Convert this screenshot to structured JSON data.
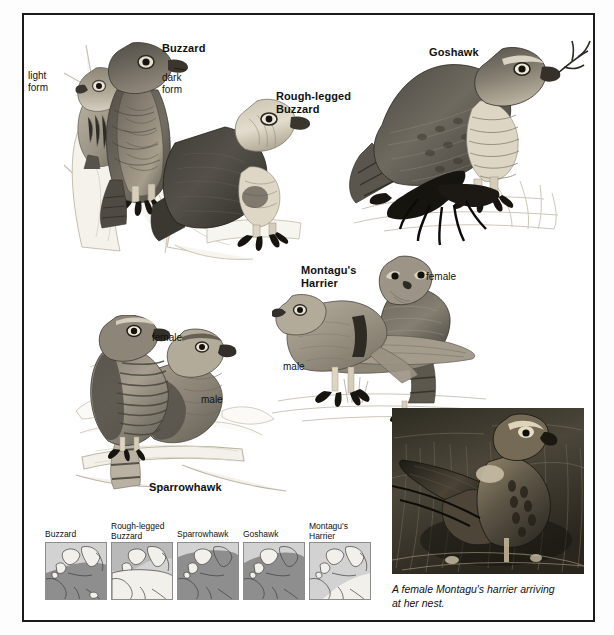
{
  "plate": {
    "title": "Birds of prey illustration plate",
    "background_color": "#ffffff",
    "border_color": "#1b1b1b"
  },
  "labels": [
    {
      "id": "buzzard-title",
      "text": "Buzzard",
      "x": 160,
      "y": 40,
      "style": "bold"
    },
    {
      "id": "light-form",
      "text": "light\nform",
      "x": 26,
      "y": 68,
      "style": "plain"
    },
    {
      "id": "dark-form",
      "text": "dark\nform",
      "x": 160,
      "y": 70,
      "style": "plain"
    },
    {
      "id": "rough-legged-title",
      "text": "Rough-legged\nBuzzard",
      "x": 274,
      "y": 88,
      "style": "bold"
    },
    {
      "id": "goshawk-title",
      "text": "Goshawk",
      "x": 427,
      "y": 44,
      "style": "bold"
    },
    {
      "id": "montagus-title",
      "text": "Montagu's\nHarrier",
      "x": 299,
      "y": 262,
      "style": "bold"
    },
    {
      "id": "harrier-female",
      "text": "female",
      "x": 424,
      "y": 268,
      "style": "plain"
    },
    {
      "id": "harrier-male",
      "text": "male",
      "x": 281,
      "y": 358,
      "style": "plain"
    },
    {
      "id": "sparrowhawk-female",
      "text": "female",
      "x": 150,
      "y": 329,
      "style": "plain"
    },
    {
      "id": "sparrowhawk-male",
      "text": "male",
      "x": 199,
      "y": 391,
      "style": "plain"
    },
    {
      "id": "sparrowhawk-title",
      "text": "Sparrowhawk",
      "x": 147,
      "y": 478,
      "style": "bold"
    }
  ],
  "maps": {
    "x": 43,
    "y": 540,
    "box_width": 62,
    "box_height": 58,
    "gap": 4,
    "sea_color": "#d2d2d2",
    "land_color": "#f2f0ea",
    "range_color": "#8e8e8e",
    "items": [
      {
        "id": "map-buzzard",
        "label": "Buzzard",
        "range_pattern": "south-and-central-europe"
      },
      {
        "id": "map-rough-legged",
        "label": "Rough-legged\nBuzzard",
        "range_pattern": "far-north-scandinavia"
      },
      {
        "id": "map-sparrowhawk",
        "label": "Sparrowhawk",
        "range_pattern": "most-of-europe"
      },
      {
        "id": "map-goshawk",
        "label": "Goshawk",
        "range_pattern": "most-of-europe"
      },
      {
        "id": "map-montagus",
        "label": "Montagu's\nHarrier",
        "range_pattern": "central-and-eastern-europe"
      }
    ]
  },
  "photo": {
    "id": "montagus-harrier-photo",
    "x": 390,
    "y": 406,
    "width": 192,
    "height": 166,
    "alt_description": "Black and white photograph of a female Montagu's harrier landing at a nest among dry vegetation",
    "caption": "A female Montagu's harrier arriving\nat her nest."
  },
  "birds": [
    {
      "id": "buzzard-light-form",
      "species": "Buzzard",
      "form": "light form"
    },
    {
      "id": "buzzard-dark-form",
      "species": "Buzzard",
      "form": "dark form"
    },
    {
      "id": "rough-legged-buzzard",
      "species": "Rough-legged Buzzard",
      "form": ""
    },
    {
      "id": "goshawk",
      "species": "Goshawk",
      "form": ""
    },
    {
      "id": "montagus-male",
      "species": "Montagu's Harrier",
      "form": "male"
    },
    {
      "id": "montagus-female",
      "species": "Montagu's Harrier",
      "form": "female"
    },
    {
      "id": "sparrowhawk-female",
      "species": "Sparrowhawk",
      "form": "female"
    },
    {
      "id": "sparrowhawk-male",
      "species": "Sparrowhawk",
      "form": "male"
    }
  ]
}
